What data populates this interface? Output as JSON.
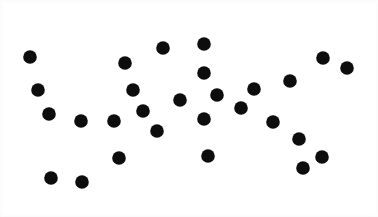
{
  "canvas": {
    "width": 378,
    "height": 217,
    "background_color": "#ffffff",
    "title": "Random dot pattern"
  },
  "marker": {
    "shape": "circle",
    "fill_color": "#0d0d0d",
    "radius": 6.8,
    "count": 32
  },
  "chart_data": {
    "type": "scatter",
    "title": "",
    "subtitle": "",
    "xlabel": "",
    "ylabel": "",
    "grid": false,
    "legend": "none",
    "axis_visible": false,
    "tick_labels_x": [],
    "tick_labels_y": [],
    "xlim": [
      0,
      378
    ],
    "ylim": [
      0,
      217
    ],
    "point_color": "#0d0d0d",
    "point_radius": 6.8,
    "n_points": 32,
    "annotations": [],
    "points": [
      {
        "x": 30,
        "y": 57
      },
      {
        "x": 38,
        "y": 90
      },
      {
        "x": 49,
        "y": 114
      },
      {
        "x": 51,
        "y": 178
      },
      {
        "x": 81,
        "y": 121
      },
      {
        "x": 82,
        "y": 182
      },
      {
        "x": 114,
        "y": 121
      },
      {
        "x": 119,
        "y": 158
      },
      {
        "x": 125,
        "y": 63
      },
      {
        "x": 133,
        "y": 90
      },
      {
        "x": 143,
        "y": 111
      },
      {
        "x": 157,
        "y": 131
      },
      {
        "x": 163,
        "y": 48
      },
      {
        "x": 180,
        "y": 100
      },
      {
        "x": 204,
        "y": 44
      },
      {
        "x": 204,
        "y": 73
      },
      {
        "x": 204,
        "y": 119
      },
      {
        "x": 208,
        "y": 156
      },
      {
        "x": 217,
        "y": 95
      },
      {
        "x": 241,
        "y": 108
      },
      {
        "x": 254,
        "y": 89
      },
      {
        "x": 273,
        "y": 122
      },
      {
        "x": 290,
        "y": 81
      },
      {
        "x": 299,
        "y": 139
      },
      {
        "x": 303,
        "y": 168
      },
      {
        "x": 322,
        "y": 157
      },
      {
        "x": 323,
        "y": 58
      },
      {
        "x": 347,
        "y": 68
      }
    ]
  }
}
